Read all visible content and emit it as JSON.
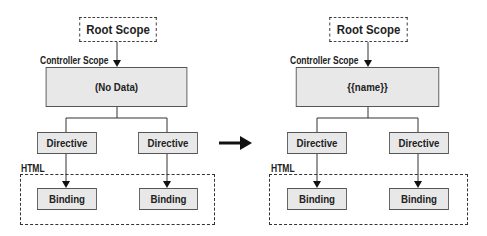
{
  "left": {
    "root": "Root Scope",
    "controller_label": "Controller Scope",
    "controller_content": "(No Data)",
    "directives": [
      "Directive",
      "Directive"
    ],
    "html_label": "HTML",
    "bindings": [
      "Binding",
      "Binding"
    ]
  },
  "right": {
    "root": "Root Scope",
    "controller_label": "Controller Scope",
    "controller_content": "{{name}}",
    "directives": [
      "Directive",
      "Directive"
    ],
    "html_label": "HTML",
    "bindings": [
      "Binding",
      "Binding"
    ]
  },
  "transition_arrow": "right-arrow"
}
